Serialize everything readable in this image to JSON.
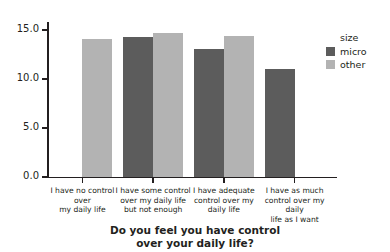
{
  "chart_data": {
    "type": "bar",
    "title": "",
    "xlabel": "Do you feel you have control over your daily life?",
    "ylabel": "Mean Hour £",
    "categories": [
      "I have no control over my daily life",
      "I have some control over my daily life but not enough",
      "I have adequate control over my daily life",
      "I have as much control over my daily life as I want"
    ],
    "category_lines": [
      [
        "I have no control over",
        "my daily life"
      ],
      [
        "I have some control",
        "over my daily life",
        "but not enough"
      ],
      [
        "I have adequate",
        "control over my",
        "daily life"
      ],
      [
        "I have as much",
        "control over my daily",
        "life as I want"
      ]
    ],
    "series": [
      {
        "name": "micro",
        "color": "#5c5c5c",
        "values": [
          null,
          14.3,
          13.0,
          11.0
        ]
      },
      {
        "name": "other",
        "color": "#b3b3b3",
        "values": [
          14.1,
          14.7,
          14.4,
          null
        ]
      }
    ],
    "ylim": [
      0.0,
      15.8
    ],
    "yticks": [
      "0.0",
      "5.0",
      "10.0",
      "15.0"
    ],
    "ytick_values": [
      0.0,
      5.0,
      10.0,
      15.0
    ],
    "grid": false,
    "legend": {
      "title": "size",
      "position": "right",
      "entries": [
        {
          "label": "micro",
          "color": "#5c5c5c"
        },
        {
          "label": "other",
          "color": "#b3b3b3"
        }
      ]
    },
    "xaxis_title_lines": [
      "Do you feel you have control",
      "over your daily life?"
    ]
  },
  "axis": {
    "ylabel": "Mean Hour £",
    "tick_0": "0.0",
    "tick_1": "5.0",
    "tick_2": "10.0",
    "tick_3": "15.0"
  },
  "legend": {
    "title": "size",
    "micro_label": "micro",
    "other_label": "other"
  },
  "xaxis": {
    "title_line_1": "Do you feel you have control",
    "title_line_2": "over your daily life?",
    "cat1_line1": "I have no control over",
    "cat1_line2": "my daily life",
    "cat2_line1": "I have some control",
    "cat2_line2": "over my daily life",
    "cat2_line3": "but not enough",
    "cat3_line1": "I have adequate",
    "cat3_line2": "control over my",
    "cat3_line3": "daily life",
    "cat4_line1": "I have as much",
    "cat4_line2": "control over my daily",
    "cat4_line3": "life as I want"
  },
  "colors": {
    "micro": "#5c5c5c",
    "other": "#b3b3b3",
    "axis": "#231f20"
  }
}
